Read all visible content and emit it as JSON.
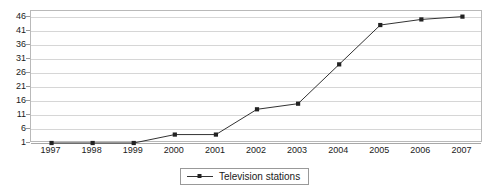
{
  "chart_data": {
    "type": "line",
    "title": "",
    "xlabel": "",
    "ylabel": "",
    "categories": [
      "1997",
      "1998",
      "1999",
      "2000",
      "2001",
      "2002",
      "2003",
      "2004",
      "2005",
      "2006",
      "2007"
    ],
    "series": [
      {
        "name": "Television stations",
        "values": [
          1,
          1,
          1,
          4,
          4,
          13,
          15,
          29,
          43,
          45,
          46
        ],
        "color": "#333333",
        "marker": "square"
      }
    ],
    "ylim": [
      1,
      48
    ],
    "yticks": [
      1,
      6,
      11,
      16,
      21,
      26,
      31,
      36,
      41,
      46
    ],
    "ytick_labels": [
      "1",
      "6",
      "11",
      "16",
      "21",
      "26",
      "31",
      "36",
      "41",
      "46"
    ],
    "grid": true,
    "grid_axis": "y",
    "legend_position": "bottom-center"
  },
  "legend": {
    "entries": [
      {
        "label": "Television stations",
        "symbol": "line-with-square-marker"
      }
    ]
  },
  "colors": {
    "series_line": "#333333",
    "gridline": "#d6d6d6",
    "plot_border": "#b9b9b9",
    "text": "#1a1a1a",
    "background": "#ffffff"
  }
}
